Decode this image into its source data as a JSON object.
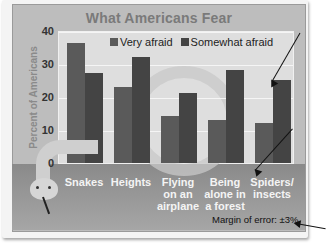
{
  "chart_data": {
    "type": "bar",
    "title": "What Americans Fear",
    "xlabel": "",
    "ylabel": "Percent of Americans",
    "ylim": [
      0,
      40
    ],
    "yticks": [
      0,
      10,
      20,
      30,
      40
    ],
    "grid": true,
    "legend_position": "top",
    "categories": [
      "Snakes",
      "Heights",
      "Flying on an airplane",
      "Being alone in a forest",
      "Spiders/ insects"
    ],
    "series": [
      {
        "name": "Very afraid",
        "color": "#5a5a5a",
        "values": [
          36,
          23,
          14,
          13,
          12
        ]
      },
      {
        "name": "Somewhat afraid",
        "color": "#444444",
        "values": [
          27,
          32,
          21,
          28,
          25
        ]
      }
    ],
    "annotations": [
      "Margin of error: ±3%"
    ]
  },
  "title": "What Americans Fear",
  "yaxis": {
    "label": "Percent of Americans",
    "ticks": [
      "0",
      "10",
      "20",
      "30",
      "40"
    ]
  },
  "legend": {
    "very_afraid": "Very afraid",
    "somewhat_afraid": "Somewhat afraid"
  },
  "categories": {
    "c0": [
      "Snakes"
    ],
    "c1": [
      "Heights"
    ],
    "c2": [
      "Flying",
      "on an",
      "airplane"
    ],
    "c3": [
      "Being",
      "alone in",
      "a forest"
    ],
    "c4": [
      "Spiders/",
      "insects"
    ]
  },
  "footnote": "Margin of error: ±3%"
}
